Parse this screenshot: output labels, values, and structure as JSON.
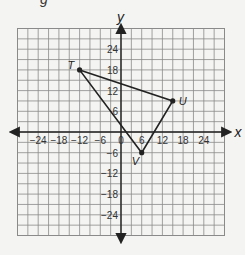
{
  "fragment_text": "g",
  "chart_data": {
    "type": "scatter",
    "title": "",
    "xlabel": "x",
    "ylabel": "y",
    "xlim": [
      -30,
      30
    ],
    "ylim": [
      -30,
      30
    ],
    "grid": true,
    "grid_step": 3,
    "x_ticks": [
      -24,
      -18,
      -12,
      -6,
      0,
      6,
      12,
      18,
      24
    ],
    "y_ticks": [
      24,
      18,
      12,
      6,
      -6,
      -12,
      -18,
      -24
    ],
    "x_tick_labels": [
      "−24",
      "−18",
      "−12",
      "−6",
      "0",
      "6",
      "12",
      "18",
      "24"
    ],
    "y_tick_labels": [
      "24",
      "18",
      "12",
      "6",
      "−6",
      "−12",
      "−18",
      "−24"
    ],
    "points": [
      {
        "label": "T",
        "x": -12,
        "y": 18
      },
      {
        "label": "U",
        "x": 15,
        "y": 9
      },
      {
        "label": "V",
        "x": 6,
        "y": -6
      }
    ],
    "polygon": [
      "T",
      "U",
      "V"
    ],
    "shape": "triangle TUV"
  },
  "colors": {
    "background": "#f4f4f2",
    "grid": "#8a8a8a",
    "axis": "#222222",
    "triangle": "#222222"
  }
}
